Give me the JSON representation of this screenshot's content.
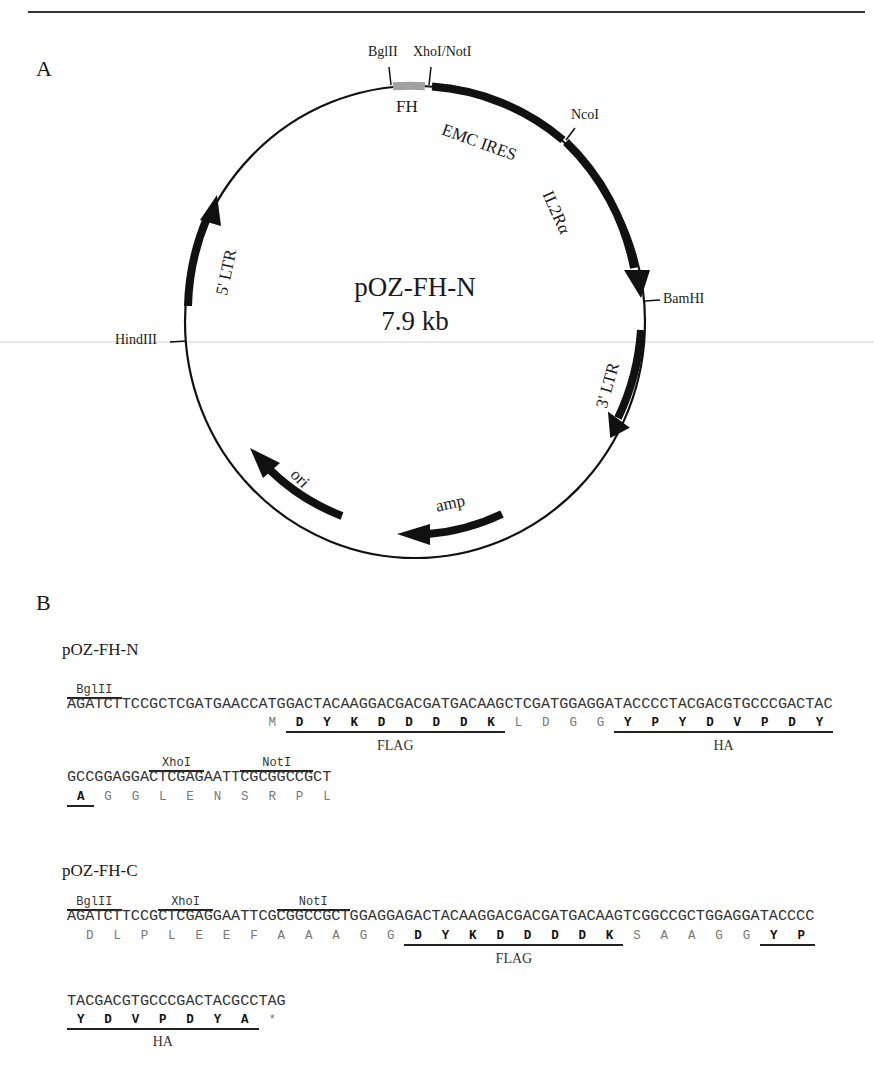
{
  "panels": {
    "a_label": "A",
    "b_label": "B"
  },
  "plasmid_map": {
    "name": "pOZ-FH-N",
    "size": "7.9 kb",
    "features": [
      {
        "label": "FH",
        "type": "tag",
        "color": "#a0a0a0"
      },
      {
        "label": "EMC IRES",
        "type": "block"
      },
      {
        "label": "IL2Rα",
        "type": "arrow"
      },
      {
        "label": "3' LTR",
        "type": "arrow"
      },
      {
        "label": "amp",
        "type": "arrow"
      },
      {
        "label": "ori",
        "type": "arrow"
      },
      {
        "label": "5' LTR",
        "type": "arrow"
      }
    ],
    "sites": {
      "bglii": "BglII",
      "xhoi_noti": "XhoI/NotI",
      "ncoi": "NcoI",
      "bamhi": "BamHI",
      "hindiii": "HindIII"
    }
  },
  "seq_n": {
    "title": "pOZ-FH-N",
    "line1": {
      "sites": [
        {
          "label": "BglII",
          "start": 0,
          "len": 6
        }
      ],
      "dna": "AGATCTTCCGCTCGATGAACCATGGACTACAAGGACGACGATGACAAGCTCGATGGAGGATACCCCTACGACGTGCCCGACTAC",
      "frame_start": 21,
      "aa": [
        "M",
        "D",
        "Y",
        "K",
        "D",
        "D",
        "D",
        "D",
        "K",
        "L",
        "D",
        "G",
        "G",
        "Y",
        "P",
        "Y",
        "D",
        "V",
        "P",
        "D",
        "Y"
      ],
      "aa_tag": [
        false,
        true,
        true,
        true,
        true,
        true,
        true,
        true,
        true,
        false,
        false,
        false,
        false,
        true,
        true,
        true,
        true,
        true,
        true,
        true,
        true
      ],
      "tags": [
        {
          "label": "FLAG",
          "from": 1,
          "to": 8
        },
        {
          "label": "HA",
          "from": 13,
          "to": 20
        }
      ]
    },
    "line2": {
      "sites": [
        {
          "label": "XhoI",
          "start": 9,
          "len": 6
        },
        {
          "label": "NotI",
          "start": 19,
          "len": 8
        }
      ],
      "dna": "GCCGGAGGACTCGAGAATTCGCGGCCGCT",
      "frame_start": 0,
      "aa": [
        "A",
        "G",
        "G",
        "L",
        "E",
        "N",
        "S",
        "R",
        "P",
        "L"
      ],
      "aa_tag": [
        true,
        false,
        false,
        false,
        false,
        false,
        false,
        false,
        false,
        false
      ],
      "tags": [
        {
          "label": "",
          "from": 0,
          "to": 0
        }
      ]
    }
  },
  "seq_c": {
    "title": "pOZ-FH-C",
    "line1": {
      "sites": [
        {
          "label": "BglII",
          "start": 0,
          "len": 6
        },
        {
          "label": "XhoI",
          "start": 10,
          "len": 6
        },
        {
          "label": "NotI",
          "start": 23,
          "len": 8
        }
      ],
      "dna": "AGATCTTCCGCTCGAGGAATTCGCGGCCGCTGGAGGAGACTACAAGGACGACGATGACAAGTCGGCCGCTGGAGGATACCCC",
      "frame_start": 1,
      "aa": [
        "D",
        "L",
        "P",
        "L",
        "E",
        "E",
        "F",
        "A",
        "A",
        "A",
        "G",
        "G",
        "D",
        "Y",
        "K",
        "D",
        "D",
        "D",
        "D",
        "K",
        "S",
        "A",
        "A",
        "G",
        "G",
        "Y",
        "P"
      ],
      "aa_tag": [
        false,
        false,
        false,
        false,
        false,
        false,
        false,
        false,
        false,
        false,
        false,
        false,
        true,
        true,
        true,
        true,
        true,
        true,
        true,
        true,
        false,
        false,
        false,
        false,
        false,
        true,
        true
      ],
      "tags": [
        {
          "label": "FLAG",
          "from": 12,
          "to": 19
        },
        {
          "label": "",
          "from": 25,
          "to": 26
        }
      ]
    },
    "line2": {
      "sites": [],
      "dna": "TACGACGTGCCCGACTACGCCTAG",
      "frame_start": 0,
      "aa": [
        "Y",
        "D",
        "V",
        "P",
        "D",
        "Y",
        "A",
        "*"
      ],
      "aa_tag": [
        true,
        true,
        true,
        true,
        true,
        true,
        true,
        false
      ],
      "tags": [
        {
          "label": "HA",
          "from": 0,
          "to": 6
        }
      ]
    }
  }
}
